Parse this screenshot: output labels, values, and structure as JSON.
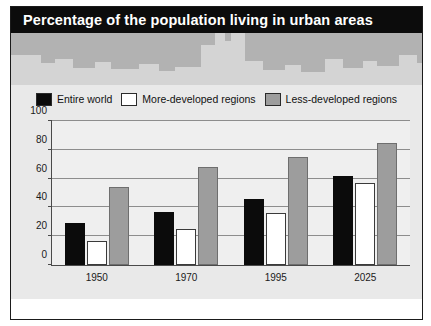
{
  "banner": {
    "title": "Percentage of the population living in urban areas"
  },
  "legend": {
    "items": [
      {
        "key": "entire-world",
        "label": "Entire world",
        "color": "#0b0b0b"
      },
      {
        "key": "more-developed-regions",
        "label": "More-developed regions",
        "color": "#ffffff"
      },
      {
        "key": "less-developed-regions",
        "label": "Less-developed regions",
        "color": "#9d9d9d"
      }
    ]
  },
  "source": {
    "text": "Source: United Nations, 1995"
  },
  "chart_data": {
    "type": "bar",
    "title": "Percentage of the population living in urban areas",
    "xlabel": "",
    "ylabel": "",
    "ylim": [
      0,
      100
    ],
    "yticks": [
      0,
      20,
      40,
      60,
      80,
      100
    ],
    "ytick_labels": [
      "0",
      "20",
      "40",
      "60",
      "80",
      "100"
    ],
    "grid": true,
    "legend_position": "top",
    "categories": [
      "1950",
      "1970",
      "1995",
      "2025"
    ],
    "series": [
      {
        "name": "Entire world",
        "color": "#0b0b0b",
        "values": [
          29,
          37,
          46,
          62
        ]
      },
      {
        "name": "More-developed regions",
        "color": "#ffffff",
        "values": [
          17,
          25,
          36,
          57
        ]
      },
      {
        "name": "Less-developed regions",
        "color": "#9d9d9d",
        "values": [
          54,
          68,
          75,
          85
        ]
      }
    ]
  },
  "skyline": {
    "buildings": [
      {
        "left": 0,
        "width": 30,
        "height": 30
      },
      {
        "left": 30,
        "width": 14,
        "height": 22
      },
      {
        "left": 44,
        "width": 18,
        "height": 26
      },
      {
        "left": 62,
        "width": 22,
        "height": 17
      },
      {
        "left": 84,
        "width": 16,
        "height": 23
      },
      {
        "left": 100,
        "width": 28,
        "height": 16
      },
      {
        "left": 128,
        "width": 20,
        "height": 21
      },
      {
        "left": 148,
        "width": 16,
        "height": 14
      },
      {
        "left": 164,
        "width": 26,
        "height": 18
      },
      {
        "left": 190,
        "width": 14,
        "height": 40
      },
      {
        "left": 204,
        "width": 10,
        "height": 52
      },
      {
        "left": 214,
        "width": 6,
        "height": 44
      },
      {
        "left": 220,
        "width": 14,
        "height": 52
      },
      {
        "left": 234,
        "width": 18,
        "height": 24
      },
      {
        "left": 252,
        "width": 22,
        "height": 15
      },
      {
        "left": 274,
        "width": 16,
        "height": 20
      },
      {
        "left": 290,
        "width": 24,
        "height": 13
      },
      {
        "left": 314,
        "width": 18,
        "height": 26
      },
      {
        "left": 332,
        "width": 20,
        "height": 17
      },
      {
        "left": 352,
        "width": 14,
        "height": 24
      },
      {
        "left": 366,
        "width": 22,
        "height": 19
      },
      {
        "left": 388,
        "width": 18,
        "height": 30
      },
      {
        "left": 406,
        "width": 14,
        "height": 22
      },
      {
        "left": 420,
        "width": 12,
        "height": 35
      },
      {
        "left": 432,
        "width": 20,
        "height": 17
      },
      {
        "left": 452,
        "width": 16,
        "height": 27
      },
      {
        "left": 468,
        "width": 22,
        "height": 20
      },
      {
        "left": 490,
        "width": 18,
        "height": 30
      }
    ]
  }
}
